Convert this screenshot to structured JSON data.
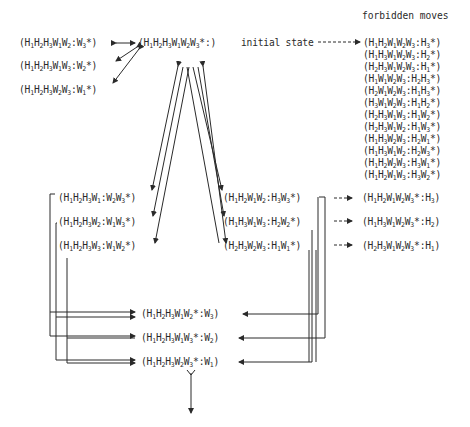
{
  "header": {
    "forbidden_title": "forbidden moves"
  },
  "initial": {
    "state": "(H1H2H3W1W2W3*:)",
    "label": "initial state"
  },
  "top_left_states": [
    "(H1H2H3W1W2:W3*)",
    "(H1H2H3W1W3:W2*)",
    "(H1H2H3W2W3:W1*)"
  ],
  "forbidden_moves": [
    "(H1H2W1W2W3:H3*)",
    "(H1H3W1W2W3:H2*)",
    "(H2H3W1W2W3:H1*)",
    "(H1W1W2W3:H2H3*)",
    "(H2W1W2W3:H1H3*)",
    "(H3W1W2W3:H1H2*)",
    "(H2H3W1W3:H1W2*)",
    "(H2H3W1W2:H1W3*)",
    "(H1H3W2W3:H2W1*)",
    "(H1H3W1W2:H2W3*)",
    "(H1H2W2W3:H3W1*)",
    "(H1H2W1W3:H3W2*)"
  ],
  "left_group": [
    "(H1H2H3W1:W2W3*)",
    "(H1H2H3W2:W1W3*)",
    "(H1H2H3W3:W1W2*)"
  ],
  "right_group": [
    "(H1H2W1W2:H3W3*)",
    "(H1H3W1W3:H2W2*)",
    "(H2H3W2W3:H1W1*)"
  ],
  "right_forbidden": [
    "(H1H2W1W2W3*:H3)",
    "(H1H3W1W2W3*:H2)",
    "(H2H3W1W2W3*:H1)"
  ],
  "bottom_states": [
    "(H1H2H3W1W2*:W3)",
    "(H1H2H3W1W3*:W2)",
    "(H1H2H3W2W3*:W1)"
  ],
  "colors": {
    "ink": "#2a2a2a",
    "background": "#ffffff"
  }
}
